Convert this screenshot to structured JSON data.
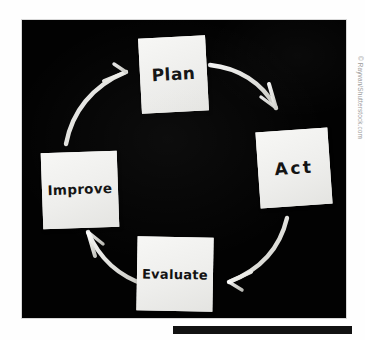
{
  "diagram": {
    "medium": "photograph of paper cards and chalk arrows on a blackboard",
    "direction": "clockwise",
    "background_color": "#020202",
    "card_color": "#f3f3f1",
    "ink_color": "#121212",
    "arrow_color": "#f2f2ee",
    "nodes": [
      {
        "id": "plan",
        "label": "Plan",
        "position": "top"
      },
      {
        "id": "act",
        "label": "Act",
        "position": "right"
      },
      {
        "id": "evaluate",
        "label": "Evaluate",
        "position": "bottom"
      },
      {
        "id": "improve",
        "label": "Improve",
        "position": "left"
      }
    ],
    "arrows": [
      {
        "id": "plan-to-act",
        "from": "Plan",
        "to": "Act",
        "name": "arrow-plan-to-act"
      },
      {
        "id": "act-to-evaluate",
        "from": "Act",
        "to": "Evaluate",
        "name": "arrow-act-to-evaluate"
      },
      {
        "id": "evaluate-to-improve",
        "from": "Evaluate",
        "to": "Improve",
        "name": "arrow-evaluate-to-improve"
      },
      {
        "id": "improve-to-plan",
        "from": "Improve",
        "to": "Plan",
        "name": "arrow-improve-to-plan"
      }
    ]
  },
  "credit": {
    "text": "© Rayvan/Shutterstock.com"
  },
  "footer": {
    "bar_color": "#111111"
  }
}
